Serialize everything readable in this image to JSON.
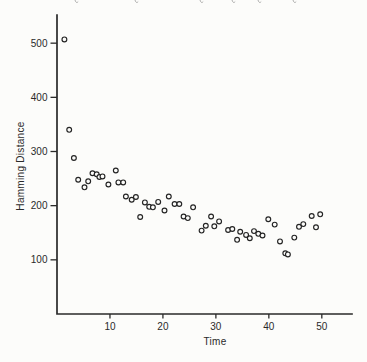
{
  "page": {
    "background": "#fcfcfa"
  },
  "caption_remnant": {
    "description": "bottom edge of a cropped italic text line at top of scan",
    "fragment_x_positions": [
      75,
      135,
      200,
      232,
      258,
      293
    ],
    "color": "#8a8a8a"
  },
  "chart_data": {
    "type": "scatter",
    "title": "",
    "xlabel": "Time",
    "ylabel": "Hamming Distance",
    "x_ticks": [
      10,
      20,
      30,
      40,
      50
    ],
    "y_ticks": [
      100,
      200,
      300,
      400,
      500
    ],
    "xlim": [
      0,
      55.7
    ],
    "ylim": [
      0,
      528
    ],
    "grid": false,
    "legend": false,
    "marker": "open-circle",
    "axis_color": "#2a2a2a",
    "point_color": "#242424",
    "points": [
      [
        1.4,
        507
      ],
      [
        2.3,
        340
      ],
      [
        3.2,
        288
      ],
      [
        4.0,
        248
      ],
      [
        5.2,
        234
      ],
      [
        5.9,
        245
      ],
      [
        6.7,
        260
      ],
      [
        7.5,
        258
      ],
      [
        8.0,
        253
      ],
      [
        8.6,
        254
      ],
      [
        9.7,
        239
      ],
      [
        11.1,
        265
      ],
      [
        11.6,
        243
      ],
      [
        12.5,
        243
      ],
      [
        13.0,
        217
      ],
      [
        14.1,
        211
      ],
      [
        14.9,
        216
      ],
      [
        15.7,
        179
      ],
      [
        16.6,
        206
      ],
      [
        17.4,
        198
      ],
      [
        18.1,
        197
      ],
      [
        19.1,
        207
      ],
      [
        20.3,
        191
      ],
      [
        21.1,
        217
      ],
      [
        22.2,
        203
      ],
      [
        23.1,
        203
      ],
      [
        23.9,
        180
      ],
      [
        24.7,
        177
      ],
      [
        25.7,
        197
      ],
      [
        27.3,
        154
      ],
      [
        28.1,
        163
      ],
      [
        29.1,
        180
      ],
      [
        29.7,
        162
      ],
      [
        30.6,
        171
      ],
      [
        32.3,
        155
      ],
      [
        33.1,
        157
      ],
      [
        34.0,
        137
      ],
      [
        34.6,
        152
      ],
      [
        35.7,
        146
      ],
      [
        36.4,
        140
      ],
      [
        37.2,
        153
      ],
      [
        38.0,
        148
      ],
      [
        38.8,
        145
      ],
      [
        39.9,
        175
      ],
      [
        41.1,
        165
      ],
      [
        42.1,
        134
      ],
      [
        43.1,
        112
      ],
      [
        43.6,
        110
      ],
      [
        44.8,
        141
      ],
      [
        45.7,
        161
      ],
      [
        46.5,
        166
      ],
      [
        48.1,
        181
      ],
      [
        48.9,
        160
      ],
      [
        49.7,
        184
      ]
    ]
  }
}
